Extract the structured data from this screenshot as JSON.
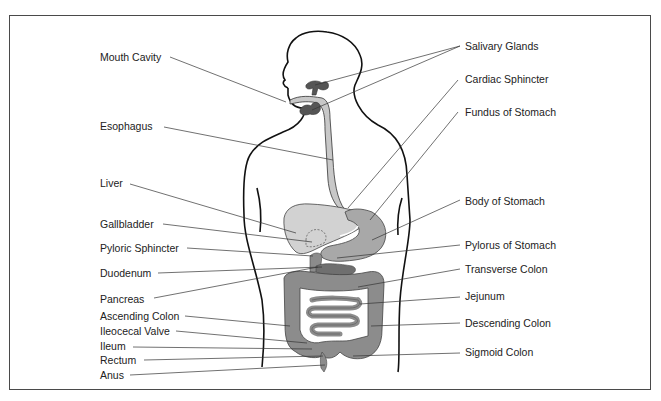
{
  "labels_left": [
    {
      "id": "mouth-cavity",
      "text": "Mouth Cavity",
      "x": 100,
      "y": 52
    },
    {
      "id": "esophagus",
      "text": "Esophagus",
      "x": 100,
      "y": 121
    },
    {
      "id": "liver",
      "text": "Liver",
      "x": 100,
      "y": 178
    },
    {
      "id": "gallbladder",
      "text": "Gallbladder",
      "x": 100,
      "y": 219
    },
    {
      "id": "pyloric-sphincter",
      "text": "Pyloric Sphincter",
      "x": 100,
      "y": 243
    },
    {
      "id": "duodenum",
      "text": "Duodenum",
      "x": 100,
      "y": 268
    },
    {
      "id": "pancreas",
      "text": "Pancreas",
      "x": 100,
      "y": 294
    },
    {
      "id": "ascending-colon",
      "text": "Ascending Colon",
      "x": 100,
      "y": 311
    },
    {
      "id": "ileocecal-valve",
      "text": "Ileocecal Valve",
      "x": 100,
      "y": 326
    },
    {
      "id": "ileum",
      "text": "Ileum",
      "x": 100,
      "y": 341
    },
    {
      "id": "rectum",
      "text": "Rectum",
      "x": 100,
      "y": 355
    },
    {
      "id": "anus",
      "text": "Anus",
      "x": 100,
      "y": 370
    }
  ],
  "labels_right": [
    {
      "id": "salivary-glands",
      "text": "Salivary Glands",
      "x": 465,
      "y": 41
    },
    {
      "id": "cardiac-sphincter",
      "text": "Cardiac Sphincter",
      "x": 465,
      "y": 74
    },
    {
      "id": "fundus-of-stomach",
      "text": "Fundus of Stomach",
      "x": 465,
      "y": 107
    },
    {
      "id": "body-of-stomach",
      "text": "Body of Stomach",
      "x": 465,
      "y": 196
    },
    {
      "id": "pylorus-of-stomach",
      "text": "Pylorus of Stomach",
      "x": 465,
      "y": 240
    },
    {
      "id": "transverse-colon",
      "text": "Transverse Colon",
      "x": 465,
      "y": 264
    },
    {
      "id": "jejunum",
      "text": "Jejunum",
      "x": 465,
      "y": 291
    },
    {
      "id": "descending-colon",
      "text": "Descending Colon",
      "x": 465,
      "y": 318
    },
    {
      "id": "sigmoid-colon",
      "text": "Sigmoid Colon",
      "x": 465,
      "y": 347
    }
  ],
  "colors": {
    "frame": "#4a4a4a",
    "outline": "#111111",
    "leader": "#333333",
    "liver": "#cfcfcf",
    "stomach": "#a9a9a9",
    "intestine": "#8c8c8c",
    "glands": "#555555",
    "esophagus": "#c8c8c8"
  }
}
